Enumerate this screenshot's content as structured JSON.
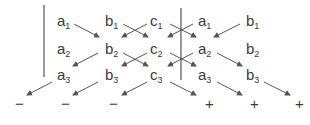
{
  "matrix": {
    "rows": [
      [
        {
          "v": "a",
          "s": "1"
        },
        {
          "v": "b",
          "s": "1"
        },
        {
          "v": "c",
          "s": "1"
        },
        {
          "v": "a",
          "s": "1"
        },
        {
          "v": "b",
          "s": "1"
        }
      ],
      [
        {
          "v": "a",
          "s": "2"
        },
        {
          "v": "b",
          "s": "2"
        },
        {
          "v": "c",
          "s": "2"
        },
        {
          "v": "a",
          "s": "2"
        },
        {
          "v": "b",
          "s": "2"
        }
      ],
      [
        {
          "v": "a",
          "s": "3"
        },
        {
          "v": "b",
          "s": "3"
        },
        {
          "v": "c",
          "s": "3"
        },
        {
          "v": "a",
          "s": "3"
        },
        {
          "v": "b",
          "s": "3"
        }
      ]
    ]
  },
  "signs": {
    "negative": [
      "−",
      "−",
      "−"
    ],
    "positive": [
      "+",
      "+",
      "+"
    ]
  },
  "colors": {
    "ink": "#3a3a3a",
    "arrow": "#555555"
  }
}
